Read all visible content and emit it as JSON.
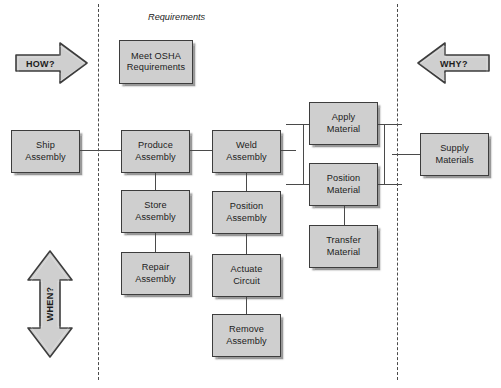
{
  "diagram": {
    "title_label": "Requirements",
    "boxes": [
      {
        "id": "meet-osha",
        "label": "Meet OSHA Requirements",
        "line1": "Meet OSHA",
        "line2": "Requirements"
      },
      {
        "id": "ship-assembly",
        "label": "Ship Assembly",
        "line1": "Ship",
        "line2": "Assembly"
      },
      {
        "id": "produce-assembly",
        "label": "Produce Assembly",
        "line1": "Produce",
        "line2": "Assembly"
      },
      {
        "id": "weld-assembly",
        "label": "Weld Assembly",
        "line1": "Weld",
        "line2": "Assembly"
      },
      {
        "id": "store-assembly",
        "label": "Store Assembly",
        "line1": "Store",
        "line2": "Assembly"
      },
      {
        "id": "repair-assembly",
        "label": "Repair Assembly",
        "line1": "Repair",
        "line2": "Assembly"
      },
      {
        "id": "position-assembly",
        "label": "Position Assembly",
        "line1": "Position",
        "line2": "Assembly"
      },
      {
        "id": "actuate-circuit",
        "label": "Actuate Circuit",
        "line1": "Actuate",
        "line2": "Circuit"
      },
      {
        "id": "remove-assembly",
        "label": "Remove Assembly",
        "line1": "Remove",
        "line2": "Assembly"
      },
      {
        "id": "apply-material",
        "label": "Apply Material",
        "line1": "Apply",
        "line2": "Material"
      },
      {
        "id": "position-material",
        "label": "Position Material",
        "line1": "Position",
        "line2": "Material"
      },
      {
        "id": "transfer-material",
        "label": "Transfer Material",
        "line1": "Transfer",
        "line2": "Material"
      },
      {
        "id": "supply-materials",
        "label": "Supply Materials",
        "line1": "Supply",
        "line2": "Materials"
      }
    ],
    "arrows": [
      {
        "id": "how-arrow",
        "label": "HOW?",
        "direction": "right"
      },
      {
        "id": "why-arrow",
        "label": "WHY?",
        "direction": "left"
      },
      {
        "id": "when-arrow",
        "label": "WHEN?",
        "direction": "up-down"
      }
    ],
    "colors": {
      "box_fill": "#cfcfcf",
      "box_border": "#3d3d3d",
      "arrow_fill": "#cfcfcf",
      "arrow_border": "#3d3d3d",
      "connector": "#4a4a4a",
      "dashed_line": "#4a4a4a",
      "text": "#1c1c1c",
      "background": "#ffffff"
    }
  }
}
